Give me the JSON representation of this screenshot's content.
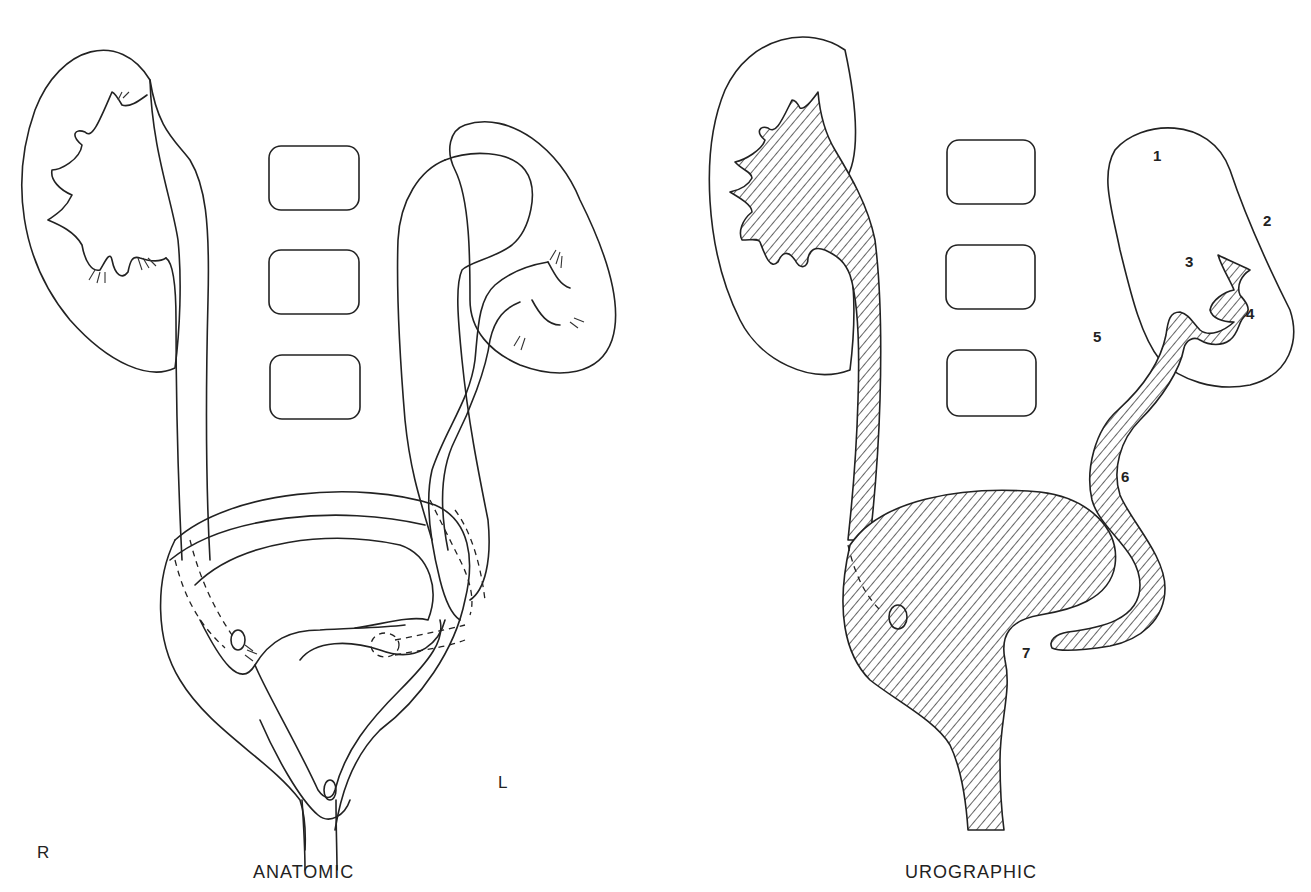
{
  "figure": {
    "panels": [
      {
        "id": "anatomic",
        "caption": "ANATOMIC"
      },
      {
        "id": "urographic",
        "caption": "UROGRAPHIC"
      }
    ],
    "orientation": {
      "right": "R",
      "left": "L"
    },
    "numbered_labels": [
      "1",
      "2",
      "3",
      "4",
      "5",
      "6",
      "7"
    ],
    "colors": {
      "ink": "#222222",
      "background": "#ffffff"
    }
  }
}
